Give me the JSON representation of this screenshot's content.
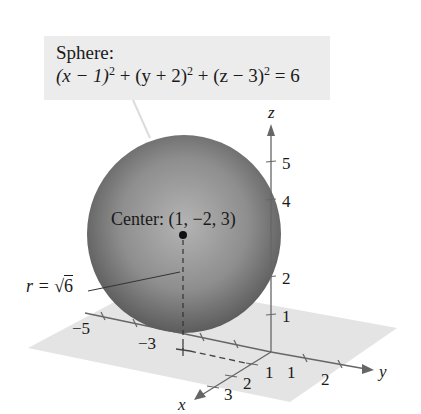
{
  "figure": {
    "title": "Sphere:",
    "equation": {
      "t1": "(x − 1)",
      "t2": " + (y + 2)",
      "t3": " + (z − 3)",
      "t4": " = 6",
      "exp": "2"
    },
    "center_label": "Center: (1, −2, 3)",
    "radius_label": {
      "prefix": "r = √",
      "value": "6"
    },
    "axes": {
      "x": {
        "label": "x",
        "ticks": [
          "1",
          "2",
          "3"
        ]
      },
      "y": {
        "label": "y",
        "ticks": [
          "−5",
          "−3",
          "1",
          "2"
        ]
      },
      "z": {
        "label": "z",
        "ticks": [
          "1",
          "2",
          "4",
          "5"
        ]
      }
    },
    "colors": {
      "label_box": "#ececec",
      "plane": "#e4e4e4",
      "sphere_light": "#b4b4b4",
      "sphere_dark": "#5c5c5c",
      "axis": "#555555",
      "text": "#1a1a1a"
    }
  }
}
